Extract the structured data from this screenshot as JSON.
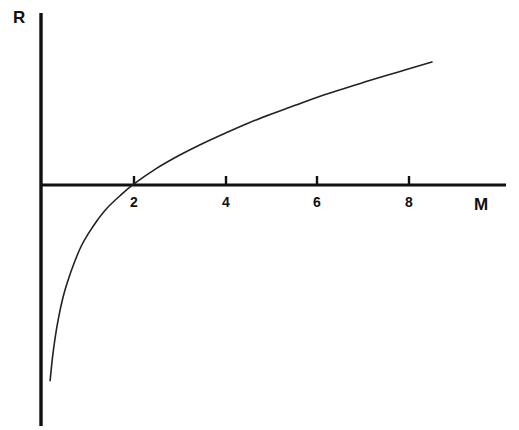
{
  "figure": {
    "background_color": "#ffffff",
    "ink_color": "#111111"
  },
  "chart_data": {
    "type": "line",
    "title": "",
    "subtitle": "",
    "xlabel": "M",
    "ylabel": "R",
    "grid": false,
    "legend": null,
    "xlim": [
      0,
      10.2
    ],
    "ylim": [
      -3.75,
      2.7
    ],
    "x_ticks": [
      2,
      4,
      6,
      8
    ],
    "x_tick_labels": [
      "2",
      "4",
      "6",
      "8"
    ],
    "y_ticks": [],
    "y_tick_labels": [],
    "axis_style": {
      "x_axis_at_y": 0,
      "y_axis_at_x": 0,
      "x_axis_drawn_range": [
        0,
        10.2
      ],
      "y_axis_drawn_range": [
        -3.75,
        2.7
      ],
      "ticks_direction": "up",
      "tick_length_px": 8
    },
    "annotations": [
      {
        "text": "R",
        "role": "y-axis-label",
        "position": "top-left of vertical axis"
      },
      {
        "text": "M",
        "role": "x-axis-label",
        "position": "right end of horizontal axis, below"
      }
    ],
    "series": [
      {
        "name": "R(M)",
        "description": "Monotonically increasing concave curve, logarithmic at small M, nearly linear for larger M; crosses R = 0 at M = 1.4",
        "zero_crossing_x": 1.4,
        "x": [
          0.17,
          0.22,
          0.28,
          0.35,
          0.45,
          0.55,
          0.7,
          0.85,
          1.0,
          1.2,
          1.4,
          1.7,
          2.0,
          2.5,
          3.0,
          3.5,
          4.0,
          4.5,
          5.0,
          5.5,
          6.0,
          6.5,
          7.0,
          7.5,
          8.0,
          8.5
        ],
        "y": [
          -3.72,
          -3.29,
          -2.9,
          -2.54,
          -2.14,
          -1.84,
          -1.47,
          -1.16,
          -0.93,
          -0.67,
          -0.45,
          -0.2,
          0.02,
          0.32,
          0.57,
          0.79,
          0.99,
          1.18,
          1.35,
          1.51,
          1.67,
          1.81,
          1.95,
          2.08,
          2.21,
          2.34
        ]
      }
    ]
  },
  "labels": {
    "y_axis_title": "R",
    "x_axis_title": "M",
    "tick_2": "2",
    "tick_4": "4",
    "tick_6": "6",
    "tick_8": "8"
  }
}
